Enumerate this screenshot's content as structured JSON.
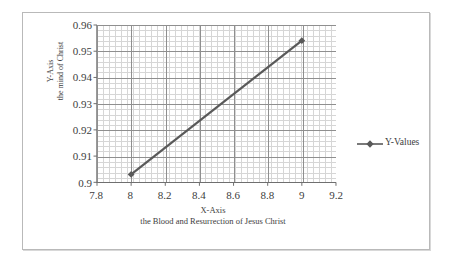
{
  "chart_data": {
    "type": "line",
    "title": "",
    "xlabel": "X-Axis",
    "xlabel2": "the Blood and Resurrection of Jesus Christ",
    "ylabel": "Y-Axis",
    "ylabel2": "the mind of Christ",
    "xlim": [
      7.8,
      9.2
    ],
    "ylim": [
      0.9,
      0.96
    ],
    "xticks": [
      "7.8",
      "8",
      "8.2",
      "8.4",
      "8.6",
      "8.8",
      "9",
      "9.2"
    ],
    "xtick_values": [
      7.8,
      8,
      8.2,
      8.4,
      8.6,
      8.8,
      9,
      9.2
    ],
    "yticks": [
      "0.96",
      "0.95",
      "0.94",
      "0.93",
      "0.92",
      "0.91",
      "0.9"
    ],
    "ytick_values": [
      0.96,
      0.95,
      0.94,
      0.93,
      0.92,
      0.91,
      0.9
    ],
    "grid": true,
    "minor_grid": true,
    "legend_position": "right",
    "series": [
      {
        "name": "Y-Values",
        "color": "#595959",
        "marker": "diamond",
        "x": [
          8,
          9
        ],
        "values": [
          0.903,
          0.954
        ]
      }
    ]
  },
  "legend": {
    "entries": [
      {
        "label": "Y-Values",
        "color": "#595959"
      }
    ]
  }
}
